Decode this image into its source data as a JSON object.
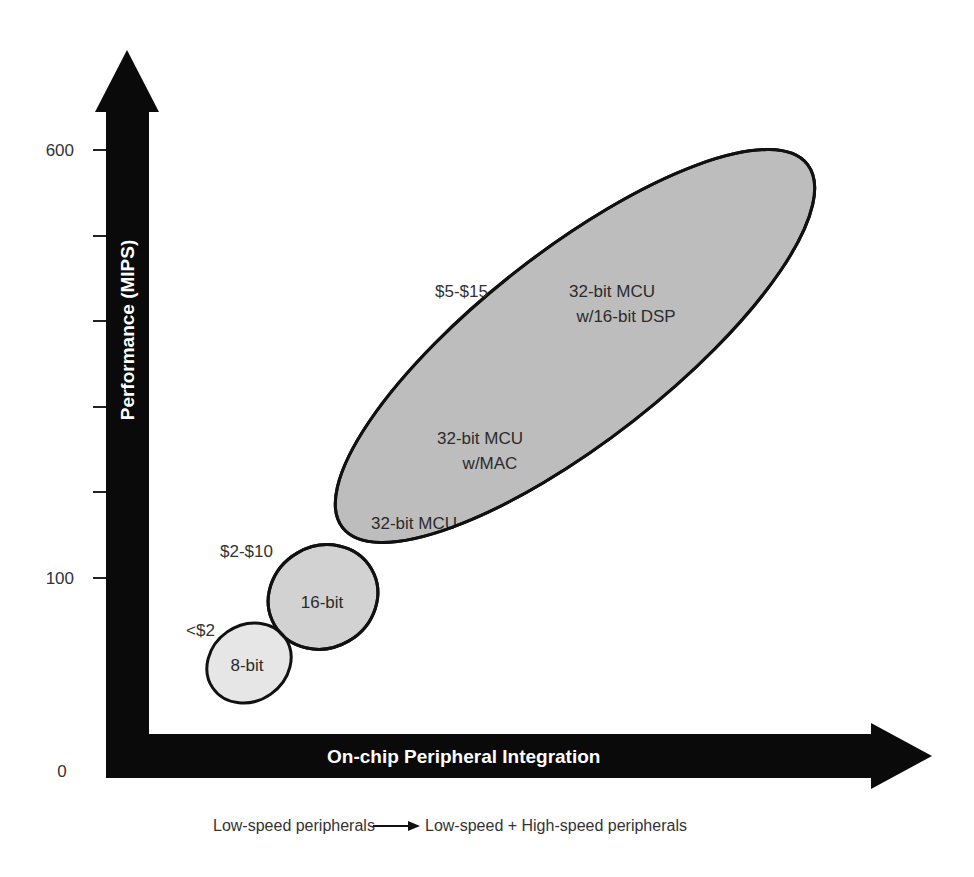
{
  "chart": {
    "y_axis": {
      "title": "Performance (MIPS)",
      "ticks": [
        {
          "label": "600"
        },
        {
          "label": ""
        },
        {
          "label": ""
        },
        {
          "label": ""
        },
        {
          "label": ""
        },
        {
          "label": "100"
        }
      ],
      "origin_label": "0"
    },
    "x_axis": {
      "title": "On-chip Peripheral Integration",
      "caption_left": "Low-speed peripherals",
      "caption_right": "Low-speed + High-speed peripherals"
    },
    "regions": [
      {
        "name": "8-bit",
        "label": "8-bit",
        "price": "<$2",
        "fill": "#e6e6e6"
      },
      {
        "name": "16-bit",
        "label": "16-bit",
        "price": "$2-$10",
        "fill": "#d2d2d2"
      },
      {
        "name": "32-bit",
        "labels": [
          "32-bit MCU",
          "32-bit MCU",
          "w/MAC",
          "32-bit MCU",
          "w/16-bit DSP"
        ],
        "price": "$5-$15",
        "fill": "#bdbdbd"
      }
    ],
    "colors": {
      "axis": "#0a0a0a",
      "outline": "#111111",
      "text": "#333333"
    }
  }
}
